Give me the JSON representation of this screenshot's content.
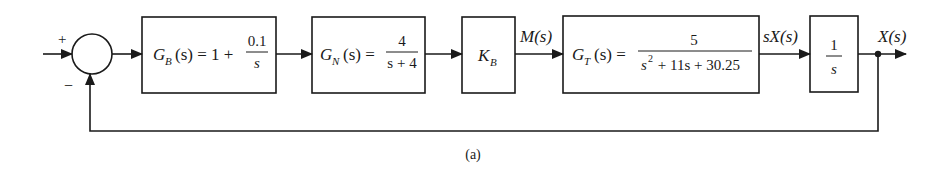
{
  "diagram": {
    "type": "block-diagram",
    "caption": "(a)",
    "summing_junction": {
      "plus_sign": "+",
      "minus_sign": "−"
    },
    "blocks": [
      {
        "id": "GB",
        "name_main": "G",
        "name_sub": "B",
        "arg": "(s) = 1 +",
        "num": "0.1",
        "den": "s"
      },
      {
        "id": "GN",
        "name_main": "G",
        "name_sub": "N",
        "arg": "(s) =",
        "num": "4",
        "den": "s + 4"
      },
      {
        "id": "KB",
        "name_main": "K",
        "name_sub": "B"
      },
      {
        "id": "GT",
        "name_main": "G",
        "name_sub": "T",
        "arg": "(s) =",
        "num": "5",
        "den_s": "s",
        "den_exp": "2",
        "den_rest": " + 11s + 30.25"
      },
      {
        "id": "INT",
        "num": "1",
        "den": "s"
      }
    ],
    "signals": {
      "m": "M(s)",
      "sx": "sX(s)",
      "x": "X(s)"
    }
  },
  "colors": {
    "line": "#1a1a1a",
    "background": "#ffffff"
  }
}
